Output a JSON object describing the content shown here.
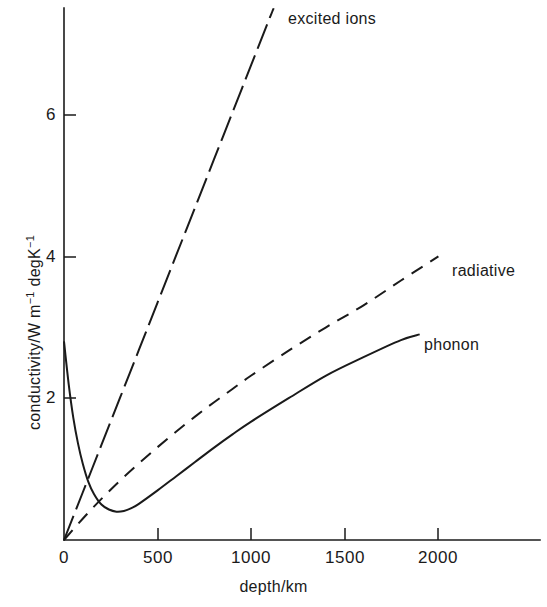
{
  "figure": {
    "background": "#ffffff",
    "ink_color": "#1a1a1a",
    "width": 547,
    "height": 607
  },
  "axes": {
    "x": {
      "title": "depth/km",
      "ticks": [
        0,
        500,
        1000,
        1500,
        2000
      ],
      "tick_labels": [
        "0",
        "500",
        "1000",
        "1500",
        "2000"
      ],
      "range": [
        0,
        2580
      ],
      "pixel_origin": 64,
      "pixel_per_unit": 0.1872
    },
    "y": {
      "title_plain": "conductivity/W m-1 degK-1",
      "title_html": "conductivity/W m<sup>−1</sup> degK<sup>−1</sup>",
      "ticks": [
        2,
        4,
        6
      ],
      "tick_labels": [
        "2",
        "4",
        "6"
      ],
      "range": [
        0,
        7.6
      ],
      "pixel_origin": 540,
      "pixel_per_unit": 70.9
    }
  },
  "chart_data": {
    "type": "line",
    "title": "",
    "xlabel": "depth/km",
    "ylabel": "conductivity/W m−1 degK−1",
    "xlim": [
      0,
      2580
    ],
    "ylim": [
      0,
      7.6
    ],
    "grid": false,
    "legend": "inline-annotations",
    "series": [
      {
        "name": "excited ions",
        "style": "long-dash",
        "label_position": "top-right-of-line",
        "x": [
          0,
          100,
          200,
          300,
          400,
          500,
          600,
          700,
          800,
          900,
          1000,
          1100,
          1120
        ],
        "y": [
          0.0,
          0.67,
          1.34,
          2.01,
          2.68,
          3.35,
          4.02,
          4.69,
          5.36,
          6.03,
          6.7,
          7.37,
          7.5
        ]
      },
      {
        "name": "radiative",
        "style": "short-dash",
        "label_position": "right-end-of-line",
        "x": [
          0,
          100,
          200,
          300,
          400,
          500,
          600,
          700,
          800,
          900,
          1000,
          1200,
          1400,
          1600,
          1800,
          2000
        ],
        "y": [
          0.0,
          0.3,
          0.58,
          0.84,
          1.08,
          1.31,
          1.53,
          1.74,
          1.94,
          2.13,
          2.32,
          2.67,
          3.0,
          3.31,
          3.66,
          4.0
        ]
      },
      {
        "name": "phonon",
        "style": "solid",
        "label_position": "right-end-of-line",
        "x": [
          0,
          25,
          50,
          75,
          100,
          130,
          160,
          200,
          240,
          280,
          320,
          360,
          400,
          500,
          600,
          700,
          800,
          900,
          1000,
          1200,
          1400,
          1600,
          1800,
          1900
        ],
        "y": [
          2.8,
          2.2,
          1.72,
          1.36,
          1.08,
          0.82,
          0.65,
          0.5,
          0.43,
          0.4,
          0.41,
          0.45,
          0.51,
          0.7,
          0.9,
          1.1,
          1.3,
          1.49,
          1.67,
          2.0,
          2.32,
          2.58,
          2.82,
          2.9
        ]
      }
    ],
    "notes": {
      "phonon_minimum_depth_km": 290,
      "phonon_minimum_value": 0.4,
      "phonon_surface_value": 2.8,
      "crossover_phonon_excited_depth_km": 175
    }
  },
  "annotations": {
    "excited_ions_label": "excited ions",
    "radiative_label": "radiative",
    "phonon_label": "phonon"
  }
}
